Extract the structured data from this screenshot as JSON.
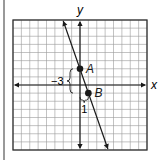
{
  "diagram": {
    "type": "coordinate-plane-line",
    "axes": {
      "x_label": "x",
      "y_label": "y",
      "x_range": [
        -8,
        8
      ],
      "y_range": [
        -8,
        8
      ]
    },
    "grid": {
      "cells_x": 16,
      "cells_y": 16
    },
    "line": {
      "slope": -3,
      "y_intercept": 2,
      "arrows_both_ends": true
    },
    "points": [
      {
        "label": "A",
        "x": 0,
        "y": 2
      },
      {
        "label": "B",
        "x": 1,
        "y": -1
      }
    ],
    "annotations": {
      "rise_label": "−3",
      "run_label": "1"
    },
    "colors": {
      "ink": "#1a1a1a",
      "grid": "#9a9a9a",
      "border": "#333333"
    }
  }
}
